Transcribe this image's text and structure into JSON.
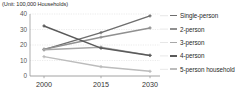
{
  "unit_note": "(Unit: 100,000 Households)",
  "legend": {
    "items": [
      {
        "label": "Single-person",
        "color": "#6e6e6e"
      },
      {
        "label": "2-person",
        "color": "#909090"
      },
      {
        "label": "3-person",
        "color": "#a8a8a8"
      },
      {
        "label": "4-person",
        "color": "#5a5a5a"
      },
      {
        "label": "5-person household",
        "color": "#bcbcbc"
      }
    ]
  },
  "chart_data": {
    "type": "line",
    "title": "",
    "subtitle": "",
    "xlabel": "",
    "ylabel": "",
    "unit": "(Unit: 100,000 Households)",
    "x": [
      "2000",
      "2015",
      "2030"
    ],
    "categories": [
      "2000",
      "2015",
      "2030"
    ],
    "xtick_labels": [
      "2000",
      "2015",
      "2030"
    ],
    "ytick_labels": [
      "0",
      "10",
      "20",
      "30",
      "40"
    ],
    "yticks": [
      0,
      10,
      20,
      30,
      40
    ],
    "ylim": [
      0,
      40
    ],
    "grid": true,
    "legend_position": "right",
    "series": [
      {
        "name": "Single-person",
        "values": [
          17.0,
          28.0,
          38.8
        ],
        "color": "#6e6e6e"
      },
      {
        "name": "2-person",
        "values": [
          17.3,
          25.0,
          31.0
        ],
        "color": "#909090"
      },
      {
        "name": "3-person",
        "values": [
          17.0,
          18.6,
          13.3
        ],
        "color": "#a8a8a8"
      },
      {
        "name": "4-person",
        "values": [
          32.3,
          18.0,
          13.3
        ],
        "color": "#5a5a5a"
      },
      {
        "name": "5-person household",
        "values": [
          12.5,
          6.0,
          3.0
        ],
        "color": "#bcbcbc"
      }
    ]
  }
}
